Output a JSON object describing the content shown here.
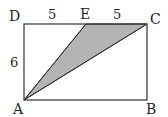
{
  "diagram": {
    "type": "geometry",
    "shape": "rectangle ABCD with shaded triangle AEC",
    "points": {
      "A": {
        "label": "A",
        "x": 24,
        "y": 100
      },
      "B": {
        "label": "B",
        "x": 147,
        "y": 100
      },
      "C": {
        "label": "C",
        "x": 147,
        "y": 24
      },
      "D": {
        "label": "D",
        "x": 24,
        "y": 24
      },
      "E": {
        "label": "E",
        "x": 86,
        "y": 24
      }
    },
    "measurements": {
      "DE": "5",
      "EC": "5",
      "AD": "6"
    },
    "shaded_region": "triangle AEC",
    "colors": {
      "stroke": "#333333",
      "fill": "#b4b4b4"
    }
  }
}
